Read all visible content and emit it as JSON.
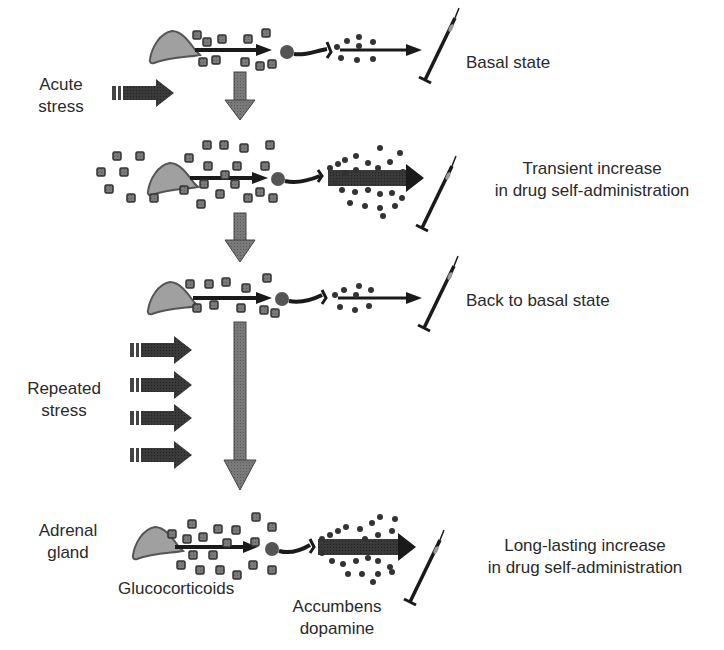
{
  "diagram": {
    "rows": [
      {
        "id": "basal",
        "y": 45,
        "intensity": "low",
        "outcome": "Basal state"
      },
      {
        "id": "transient",
        "y": 178,
        "intensity": "high",
        "outcome_line1": "Transient increase",
        "outcome_line2": "in drug self-administration"
      },
      {
        "id": "back-basal",
        "y": 300,
        "intensity": "low",
        "outcome": "Back to basal state"
      },
      {
        "id": "long-lasting",
        "y": 547,
        "intensity": "high",
        "outcome_line1": "Long-lasting increase",
        "outcome_line2": "in drug self-administration"
      }
    ],
    "stressors": {
      "acute": {
        "line1": "Acute",
        "line2": "stress",
        "arrow_count": 1
      },
      "repeated": {
        "line1": "Repeated",
        "line2": "stress",
        "arrow_count": 4
      }
    },
    "labels": {
      "adrenal_line1": "Adrenal",
      "adrenal_line2": "gland",
      "glucocorticoids": "Glucocorticoids",
      "accumbens_line1": "Accumbens",
      "accumbens_line2": "dopamine"
    },
    "colors": {
      "arrow_fill": "#6e6e6e",
      "arrow_stroke": "#3a3a3a",
      "gland_fill": "#9a9a9a",
      "dark": "#1a1a1a",
      "particle": "#5a5a5a"
    }
  }
}
